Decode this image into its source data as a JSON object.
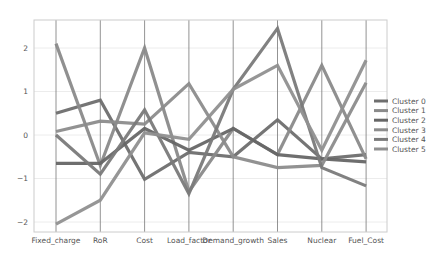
{
  "chart_data": {
    "type": "line",
    "subtype": "parallel_coordinates",
    "title": "",
    "xlabel": "",
    "ylabel": "",
    "categories": [
      "Fixed_charge",
      "RoR",
      "Cost",
      "Load_factor",
      "Demand_growth",
      "Sales",
      "Nuclear",
      "Fuel_Cost"
    ],
    "yticks": [
      -2,
      -1,
      0,
      1,
      2
    ],
    "ytick_labels": [
      "−2",
      "−1",
      "0",
      "1",
      "2"
    ],
    "ylim": [
      -2.25,
      2.7
    ],
    "grid": true,
    "legend_position": "right",
    "series": [
      {
        "name": "Cluster 0",
        "color": "#6e6e6e",
        "values": [
          0.5,
          0.8,
          -1.02,
          -0.4,
          -0.5,
          0.35,
          -0.55,
          -0.45
        ]
      },
      {
        "name": "Cluster 1",
        "color": "#8a8a8a",
        "values": [
          2.1,
          -0.7,
          2.0,
          -1.3,
          0.15,
          -0.45,
          1.6,
          -0.55
        ]
      },
      {
        "name": "Cluster 2",
        "color": "#666666",
        "values": [
          -0.65,
          -0.65,
          0.15,
          -0.35,
          0.15,
          -0.45,
          -0.55,
          -0.62
        ]
      },
      {
        "name": "Cluster 3",
        "color": "#8c8c8c",
        "values": [
          0.08,
          0.32,
          0.25,
          1.18,
          -0.5,
          -0.75,
          -0.7,
          1.2
        ]
      },
      {
        "name": "Cluster 4",
        "color": "#7a7a7a",
        "values": [
          0.0,
          -0.9,
          0.58,
          -1.35,
          1.05,
          2.45,
          -0.75,
          -1.17
        ]
      },
      {
        "name": "Cluster 5",
        "color": "#909090",
        "values": [
          -2.05,
          -1.5,
          0.05,
          -0.1,
          1.05,
          1.6,
          -0.35,
          1.72
        ]
      }
    ]
  }
}
